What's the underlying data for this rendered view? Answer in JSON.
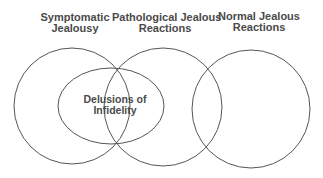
{
  "diagram": {
    "type": "venn",
    "sets": [
      {
        "id": "symptomatic",
        "label_line1": "Symptomatic",
        "label_line2": "Jealousy"
      },
      {
        "id": "pathological",
        "label_line1": "Pathological Jealous",
        "label_line2": "Reactions"
      },
      {
        "id": "normal",
        "label_line1": "Normal Jealous",
        "label_line2": "Reactions"
      }
    ],
    "subset": {
      "id": "delusions",
      "label_line1": "Delusions of",
      "label_line2": "Infidelity",
      "spans": [
        "symptomatic",
        "pathological"
      ]
    },
    "relations": [
      "Symptomatic Jealousy overlaps Pathological Jealous Reactions",
      "Pathological Jealous Reactions overlaps Normal Jealous Reactions",
      "Delusions of Infidelity lies within the union of Symptomatic Jealousy and Pathological Jealous Reactions"
    ],
    "stroke_color": "#555555",
    "text_color": "#4a4a4a"
  }
}
